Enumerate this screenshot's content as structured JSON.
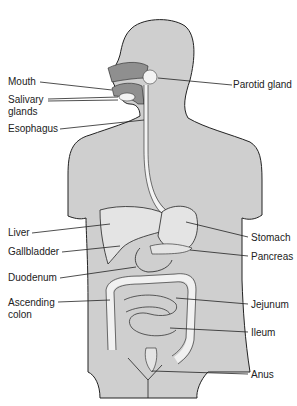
{
  "diagram": {
    "colors": {
      "body": "#cfcfcf",
      "organ": "#e4e4e4",
      "dark": "#8f8f8f",
      "line": "#222222"
    },
    "labels_left": [
      {
        "id": "mouth",
        "text": "Mouth",
        "x": 8,
        "y": 76
      },
      {
        "id": "salivary",
        "text": "Salivary",
        "x": 8,
        "y": 94
      },
      {
        "id": "salivary2",
        "text": "glands",
        "x": 8,
        "y": 106
      },
      {
        "id": "esophagus",
        "text": "Esophagus",
        "x": 8,
        "y": 123
      },
      {
        "id": "liver",
        "text": "Liver",
        "x": 8,
        "y": 227
      },
      {
        "id": "gallbladder",
        "text": "Gallbladder",
        "x": 8,
        "y": 246
      },
      {
        "id": "duodenum",
        "text": "Duodenum",
        "x": 8,
        "y": 272
      },
      {
        "id": "ascending",
        "text": "Ascending",
        "x": 8,
        "y": 297
      },
      {
        "id": "ascending2",
        "text": "colon",
        "x": 8,
        "y": 309
      }
    ],
    "labels_right": [
      {
        "id": "parotid",
        "text": "Parotid gland",
        "x": 233,
        "y": 79
      },
      {
        "id": "stomach",
        "text": "Stomach",
        "x": 251,
        "y": 232
      },
      {
        "id": "pancreas",
        "text": "Pancreas",
        "x": 251,
        "y": 251
      },
      {
        "id": "jejunum",
        "text": "Jejunum",
        "x": 251,
        "y": 299
      },
      {
        "id": "ileum",
        "text": "Ileum",
        "x": 251,
        "y": 327
      },
      {
        "id": "anus",
        "text": "Anus",
        "x": 251,
        "y": 369
      }
    ]
  }
}
